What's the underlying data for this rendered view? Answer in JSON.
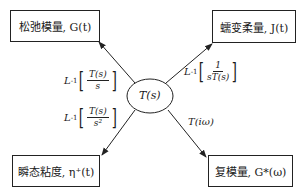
{
  "center": {
    "label": "T(s)"
  },
  "boxes": {
    "top_left": {
      "text": "松弛模量, G(t)"
    },
    "top_right": {
      "text": "蠕变柔量, J(t)"
    },
    "bottom_left": {
      "text": "瞬态粘度, η⁺(t)"
    },
    "bottom_right": {
      "text": "复模量, G*(ω)"
    }
  },
  "edges": {
    "top_left": {
      "prefix": "L",
      "sup": "-1",
      "num": "T(s)",
      "den": "s"
    },
    "top_right": {
      "prefix": "L",
      "sup": "-1",
      "num": "1",
      "den": "sT(s)"
    },
    "bottom_left": {
      "prefix": "L",
      "sup": "-1",
      "num": "T(s)",
      "den": "s²"
    },
    "bottom_right": {
      "text": "T(iω)"
    }
  }
}
